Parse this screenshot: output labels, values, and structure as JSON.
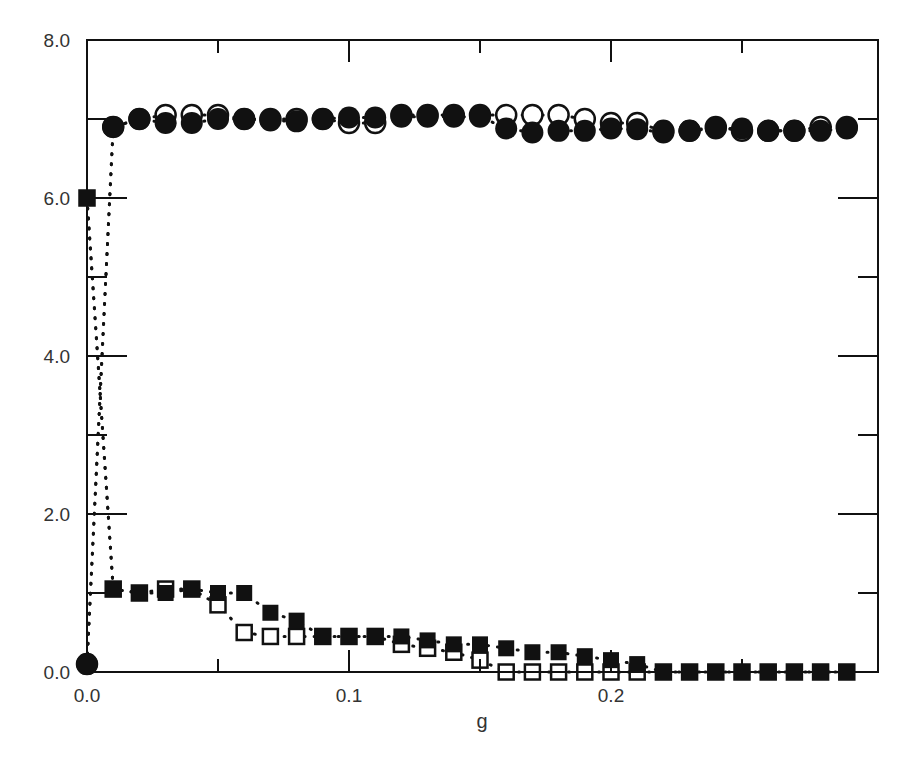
{
  "chart_data": {
    "type": "scatter",
    "title": "",
    "xlabel": "g",
    "ylabel": "",
    "xlim": [
      0.0,
      0.3
    ],
    "ylim": [
      0.0,
      8.0
    ],
    "grid": false,
    "legend": "none",
    "x_ticks": [
      {
        "value": 0.0,
        "label": "0.0"
      },
      {
        "value": 0.1,
        "label": "0.1"
      },
      {
        "value": 0.2,
        "label": "0.2"
      }
    ],
    "x_minor_ticks": [
      0.05,
      0.15,
      0.25
    ],
    "y_ticks": [
      {
        "value": 0.0,
        "label": "0.0"
      },
      {
        "value": 2.0,
        "label": "2.0"
      },
      {
        "value": 4.0,
        "label": "4.0"
      },
      {
        "value": 6.0,
        "label": "6.0"
      },
      {
        "value": 8.0,
        "label": "8.0"
      }
    ],
    "y_minor_ticks": [
      1.0,
      3.0,
      5.0,
      7.0
    ],
    "x": [
      0.0,
      0.01,
      0.02,
      0.03,
      0.04,
      0.05,
      0.06,
      0.07,
      0.08,
      0.09,
      0.1,
      0.11,
      0.12,
      0.13,
      0.14,
      0.15,
      0.16,
      0.17,
      0.18,
      0.19,
      0.2,
      0.21,
      0.22,
      0.23,
      0.24,
      0.25,
      0.26,
      0.27,
      0.28,
      0.29
    ],
    "series": [
      {
        "name": "open circles",
        "marker": "circle-open",
        "values": [
          0.1,
          6.9,
          7.0,
          7.05,
          7.05,
          7.05,
          7.0,
          7.0,
          7.0,
          7.0,
          6.95,
          6.95,
          7.05,
          7.05,
          7.05,
          7.05,
          7.05,
          7.05,
          7.05,
          7.0,
          6.95,
          6.95,
          6.85,
          6.85,
          6.9,
          6.85,
          6.85,
          6.85,
          6.9,
          6.9
        ]
      },
      {
        "name": "filled circles",
        "marker": "circle-filled",
        "values": [
          0.1,
          6.9,
          7.0,
          6.95,
          6.95,
          7.0,
          7.0,
          6.98,
          6.97,
          7.0,
          7.02,
          7.02,
          7.03,
          7.03,
          7.03,
          7.03,
          6.88,
          6.83,
          6.85,
          6.85,
          6.88,
          6.87,
          6.83,
          6.85,
          6.88,
          6.88,
          6.85,
          6.85,
          6.85,
          6.88
        ]
      },
      {
        "name": "open squares",
        "marker": "square-open",
        "values": [
          6.0,
          1.05,
          1.0,
          1.05,
          1.05,
          0.85,
          0.5,
          0.45,
          0.45,
          0.45,
          0.45,
          0.45,
          0.35,
          0.3,
          0.25,
          0.15,
          0.0,
          0.0,
          0.0,
          0.0,
          0.0,
          0.0,
          0.0,
          0.0,
          0.0,
          0.0,
          0.0,
          0.0,
          0.0,
          0.0
        ]
      },
      {
        "name": "filled squares",
        "marker": "square-filled",
        "values": [
          6.0,
          1.05,
          1.0,
          1.0,
          1.05,
          1.0,
          1.0,
          0.75,
          0.65,
          0.45,
          0.45,
          0.45,
          0.45,
          0.4,
          0.35,
          0.35,
          0.3,
          0.25,
          0.25,
          0.2,
          0.15,
          0.1,
          0.0,
          0.0,
          0.0,
          0.0,
          0.0,
          0.0,
          0.0,
          0.0
        ]
      }
    ]
  },
  "colors": {
    "axis": "#111111",
    "marker": "#111111",
    "text": "#333333"
  }
}
